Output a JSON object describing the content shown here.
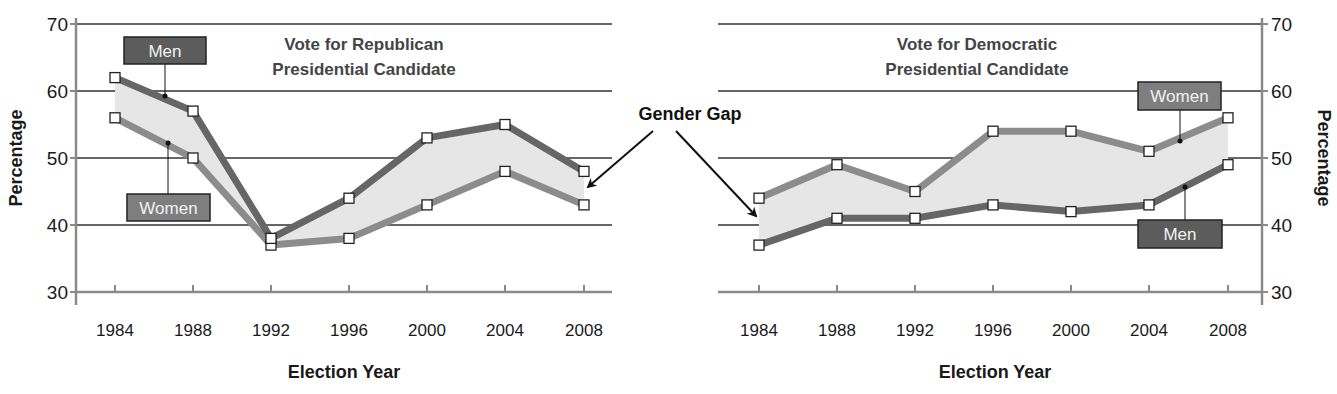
{
  "chart_data": [
    {
      "type": "line",
      "title": "Vote for Republican Presidential Candidate",
      "title_lines": [
        "Vote for Republican",
        "Presidential Candidate"
      ],
      "xlabel": "Election Year",
      "ylabel": "Percentage",
      "ylim": [
        30,
        70
      ],
      "yticks": [
        30,
        40,
        50,
        60,
        70
      ],
      "y_axis_side": "left",
      "grid": true,
      "categories": [
        "1984",
        "1988",
        "1992",
        "1996",
        "2000",
        "2004",
        "2008"
      ],
      "series": [
        {
          "name": "Men",
          "values": [
            62,
            57,
            38,
            44,
            53,
            55,
            48
          ],
          "color": "#666666"
        },
        {
          "name": "Women",
          "values": [
            56,
            50,
            37,
            38,
            43,
            48,
            43
          ],
          "color": "#8c8c8c"
        }
      ],
      "shaded_area": "gap between Men and Women series",
      "legend": {
        "men_label": "Men",
        "women_label": "Women",
        "men_position": "top",
        "women_position": "bottom"
      }
    },
    {
      "type": "line",
      "title": "Vote for Democratic Presidential Candidate",
      "title_lines": [
        "Vote for Democratic",
        "Presidential Candidate"
      ],
      "xlabel": "Election Year",
      "ylabel": "Percentage",
      "ylim": [
        30,
        70
      ],
      "yticks": [
        30,
        40,
        50,
        60,
        70
      ],
      "y_axis_side": "right",
      "grid": true,
      "categories": [
        "1984",
        "1988",
        "1992",
        "1996",
        "2000",
        "2004",
        "2008"
      ],
      "series": [
        {
          "name": "Women",
          "values": [
            44,
            49,
            45,
            54,
            54,
            51,
            56
          ],
          "color": "#8c8c8c"
        },
        {
          "name": "Men",
          "values": [
            37,
            41,
            41,
            43,
            42,
            43,
            49
          ],
          "color": "#666666"
        }
      ],
      "shaded_area": "gap between Women and Men series",
      "legend": {
        "women_label": "Women",
        "men_label": "Men",
        "women_position": "top",
        "men_position": "bottom"
      }
    }
  ],
  "annotation": {
    "label": "Gender Gap",
    "points_to": [
      "shaded area of Republican chart",
      "shaded area of Democratic chart"
    ]
  },
  "colors": {
    "men_line": "#666666",
    "women_line": "#8c8c8c",
    "men_box": "#5c5c5c",
    "women_box": "#7e7e7e",
    "gap_fill": "#e6e6e6",
    "grid": "#333333",
    "axis": "#8a8a8a",
    "text": "#1a1a1a",
    "title_text": "#444444"
  }
}
